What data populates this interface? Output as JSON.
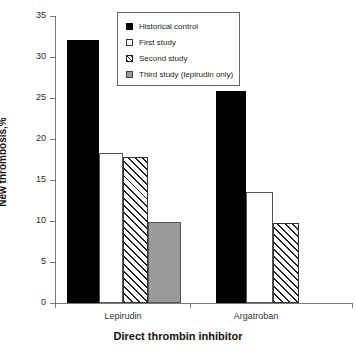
{
  "chart_data": {
    "type": "bar",
    "title": "",
    "xlabel": "Direct thrombin inhibitor",
    "ylabel": "New thrombosis,%",
    "categories": [
      "Lepirudin",
      "Argatroban"
    ],
    "ylim": [
      0,
      35
    ],
    "yticks": [
      0,
      5,
      10,
      15,
      20,
      25,
      30,
      35
    ],
    "ytick_labels": [
      "0",
      "5",
      "10",
      "15",
      "20",
      "25",
      "30",
      "35"
    ],
    "grid": false,
    "legend_position": "top-center",
    "series": [
      {
        "name": "Historical control",
        "style": "solid-black",
        "color": "#000000",
        "values": [
          32.1,
          25.8
        ]
      },
      {
        "name": "First study",
        "style": "open-white",
        "color": "#ffffff",
        "values": [
          18.3,
          13.5
        ]
      },
      {
        "name": "Second study",
        "style": "hatched",
        "color": "#ffffff",
        "values": [
          17.8,
          9.8
        ]
      },
      {
        "name": "Third study (lepirudin only)",
        "style": "solid-gray",
        "color": "#9a9a9a",
        "values": [
          9.9,
          null
        ]
      }
    ]
  },
  "legend": {
    "items": [
      {
        "label": "Historical control",
        "swatch": "solid"
      },
      {
        "label": "First study",
        "swatch": "open"
      },
      {
        "label": "Second study",
        "swatch": "hatch"
      },
      {
        "label": "Third study (lepirudin only)",
        "swatch": "gray"
      }
    ]
  }
}
